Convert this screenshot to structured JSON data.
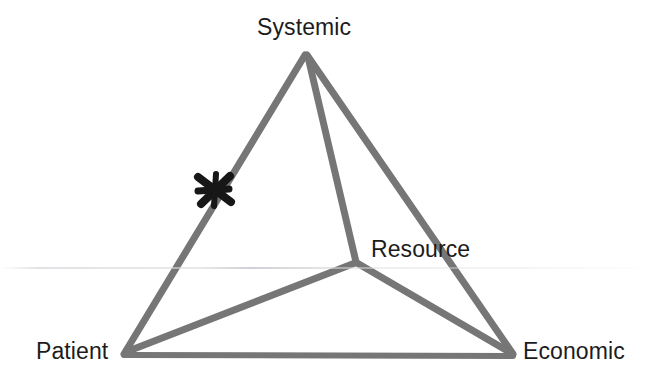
{
  "figure": {
    "background_color": "#ffffff",
    "width": 658,
    "height": 384
  },
  "style": {
    "edge_color": "#767676",
    "edge_color_dark": "#6b6b6b",
    "edge_width": 7,
    "base_edge_width": 6,
    "marker_color": "#171717",
    "label_color": "#1c1c1c"
  },
  "chart_data": {
    "type": "diagram",
    "subtype": "tetrahedron-projection",
    "nodes": [
      {
        "id": "systemic",
        "label": "Systemic",
        "x": 305,
        "y": 54,
        "label_x": 257,
        "label_y": 16,
        "role": "apex-vertex"
      },
      {
        "id": "patient",
        "label": "Patient",
        "x": 123,
        "y": 354,
        "label_x": 36,
        "label_y": 340,
        "role": "bottom-left-vertex"
      },
      {
        "id": "economic",
        "label": "Economic",
        "x": 513,
        "y": 356,
        "label_x": 523,
        "label_y": 340,
        "role": "bottom-right-vertex"
      },
      {
        "id": "resource",
        "label": "Resource",
        "x": 355,
        "y": 262,
        "label_x": 371,
        "label_y": 238,
        "role": "interior-vertex"
      }
    ],
    "edges": [
      {
        "from": "systemic",
        "to": "patient",
        "kind": "outer"
      },
      {
        "from": "systemic",
        "to": "economic",
        "kind": "outer"
      },
      {
        "from": "patient",
        "to": "economic",
        "kind": "outer"
      },
      {
        "from": "systemic",
        "to": "resource",
        "kind": "inner"
      },
      {
        "from": "patient",
        "to": "resource",
        "kind": "inner"
      },
      {
        "from": "economic",
        "to": "resource",
        "kind": "inner"
      }
    ],
    "annotations": [
      {
        "id": "x-marker",
        "type": "cross-marker",
        "label": "X",
        "x": 215,
        "y": 190,
        "size": 36,
        "on_edge": "systemic-patient",
        "color": "#171717"
      }
    ],
    "xlabel": "",
    "ylabel": "",
    "legend": [],
    "grid": false
  },
  "labels": {
    "systemic": "Systemic",
    "resource": "Resource",
    "patient": "Patient",
    "economic": "Economic"
  }
}
